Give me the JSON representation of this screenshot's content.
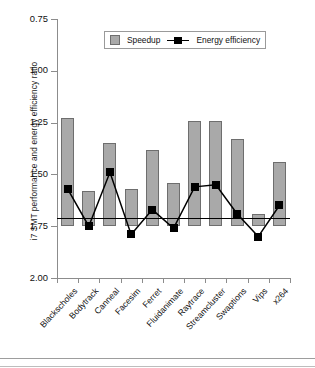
{
  "figure": {
    "ylabel": "i7 SMT performance and energy efficiency ratio",
    "bottom_rule": ""
  },
  "legend": {
    "speedup_label": "Speedup",
    "energy_label": "Energy efficiency",
    "speedup_color": "#a9a9a9",
    "energy_color": "#000000"
  },
  "axis": {
    "yticks": [
      "2.00",
      "1.75",
      "1.50",
      "1.25",
      "1.00",
      "0.75"
    ],
    "ytick_values": [
      2.0,
      1.75,
      1.5,
      1.25,
      1.0,
      0.75
    ]
  },
  "chart_data": {
    "type": "bar",
    "title": "",
    "xlabel": "",
    "ylabel": "i7 SMT performance and energy efficiency ratio",
    "ylim": [
      0.75,
      2.0
    ],
    "yticks": [
      0.75,
      1.0,
      1.25,
      1.5,
      1.75,
      2.0
    ],
    "grid": false,
    "legend_position": "top-center",
    "baseline": 1.0,
    "categories": [
      "Blackscholes",
      "Bodytrack",
      "Canneal",
      "Facesim",
      "Ferret",
      "Fluidanimate",
      "Raytrace",
      "Streamcluster",
      "Swaptions",
      "Vips",
      "x264"
    ],
    "series": [
      {
        "name": "Speedup",
        "type": "bar",
        "color": "#a9a9a9",
        "values": [
          1.52,
          1.17,
          1.4,
          1.18,
          1.37,
          1.21,
          1.51,
          1.51,
          1.42,
          1.06,
          1.31
        ]
      },
      {
        "name": "Energy efficiency",
        "type": "line",
        "color": "#000000",
        "marker": "square",
        "values": [
          1.18,
          1.0,
          1.26,
          0.96,
          1.08,
          0.99,
          1.19,
          1.2,
          1.06,
          0.95,
          1.1
        ]
      }
    ]
  }
}
